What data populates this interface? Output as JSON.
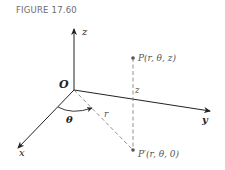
{
  "figure": {
    "caption": "FIGURE 17.60"
  },
  "axes": {
    "z_label": "z",
    "y_label": "y",
    "x_label": "x",
    "origin_label": "O"
  },
  "annotations": {
    "theta_label": "θ",
    "r_label": "r",
    "height_label": "z"
  },
  "points": {
    "P": "P(r, θ, z)",
    "P_prime": "P′(r, θ, 0)"
  },
  "colors": {
    "axis": "#222222",
    "dashed": "#777777",
    "point": "#555555",
    "caption": "#6b6b6b"
  }
}
